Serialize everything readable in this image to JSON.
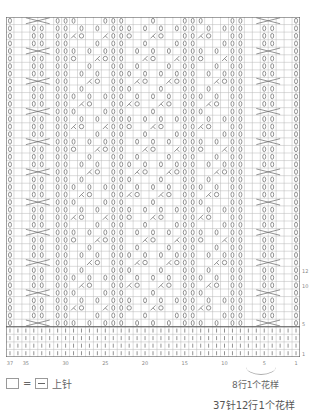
{
  "chart_data": {
    "type": "table",
    "columns": 37,
    "rows": 45,
    "column_labels": [
      {
        "col": 37,
        "label": "37"
      },
      {
        "col": 35,
        "label": "35"
      },
      {
        "col": 30,
        "label": "30"
      },
      {
        "col": 25,
        "label": "25"
      },
      {
        "col": 20,
        "label": "20"
      },
      {
        "col": 15,
        "label": "15"
      },
      {
        "col": 10,
        "label": "10"
      },
      {
        "col": 5,
        "label": "5"
      },
      {
        "col": 1,
        "label": "1"
      }
    ],
    "row_labels": [
      {
        "row": 12,
        "label": "12"
      },
      {
        "row": 10,
        "label": "10"
      },
      {
        "row": 5,
        "label": "5"
      },
      {
        "row": 1,
        "label": "1"
      }
    ],
    "symbols": {
      "twisted_knit": "ℓ",
      "yarn_over": "O",
      "decrease": "λ",
      "knit": "|"
    },
    "twisted_columns": [
      1,
      8,
      9,
      14,
      15,
      23,
      24,
      30,
      31,
      37
    ],
    "cable_columns": [
      [
        3,
        6
      ],
      [
        32,
        35
      ]
    ],
    "grid": true
  },
  "legend": {
    "equals": "=",
    "label": "上针"
  },
  "notes": {
    "repeat_rows": "8行1个花样",
    "pattern_repeat": "37针12行1个花样"
  },
  "colors": {
    "grid": "#b8b8b8",
    "symbol": "#777777",
    "bold_line": "#555555"
  }
}
